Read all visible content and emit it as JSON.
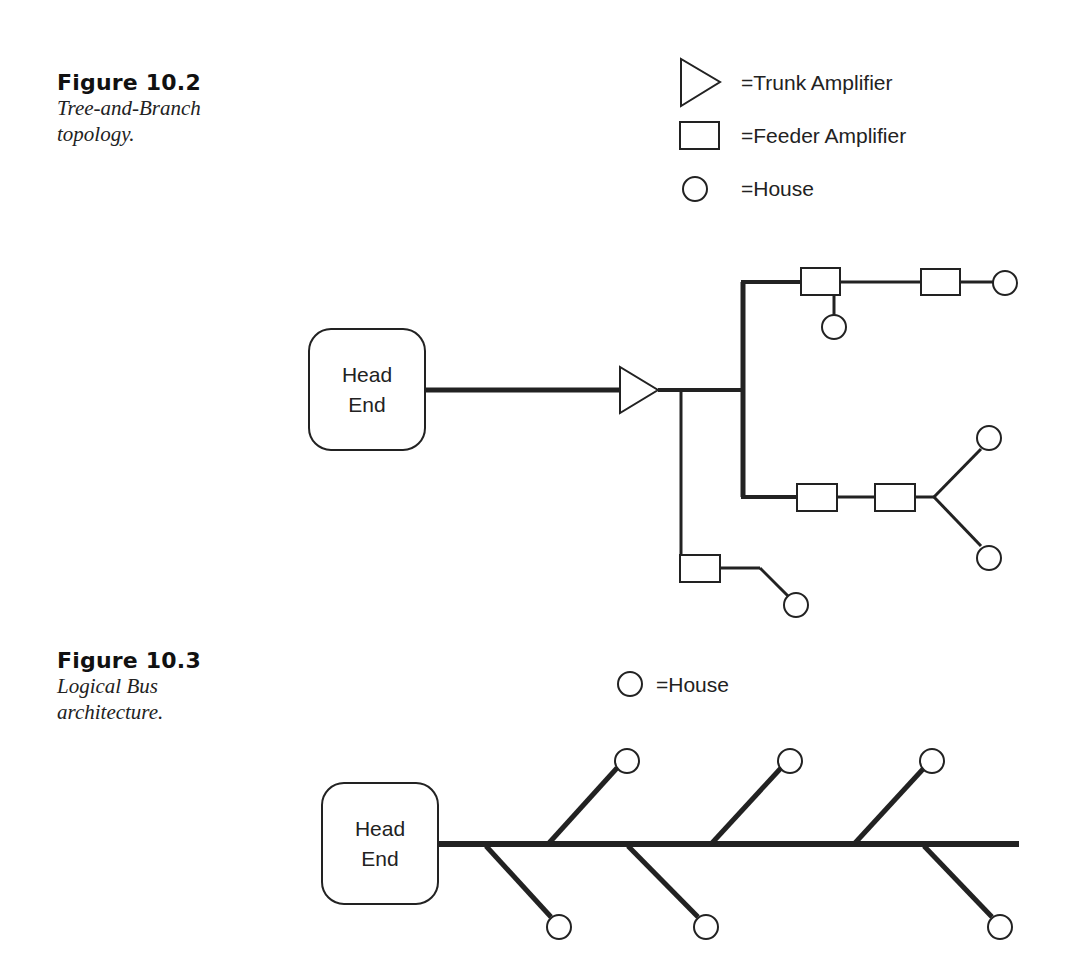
{
  "figures": [
    {
      "number": "Figure 10.2",
      "caption_line1": "Tree-and-Branch",
      "caption_line2": "topology.",
      "legend": [
        {
          "symbol": "triangle-icon",
          "label": "=Trunk Amplifier"
        },
        {
          "symbol": "rectangle-icon",
          "label": "=Feeder Amplifier"
        },
        {
          "symbol": "circle-icon",
          "label": "=House"
        }
      ],
      "head_end": {
        "line1": "Head",
        "line2": "End"
      }
    },
    {
      "number": "Figure 10.3",
      "caption_line1": "Logical Bus",
      "caption_line2": "architecture.",
      "legend": [
        {
          "symbol": "circle-icon",
          "label": "=House"
        }
      ],
      "head_end": {
        "line1": "Head",
        "line2": "End"
      }
    }
  ],
  "colors": {
    "line": "#222222",
    "background": "#ffffff"
  }
}
